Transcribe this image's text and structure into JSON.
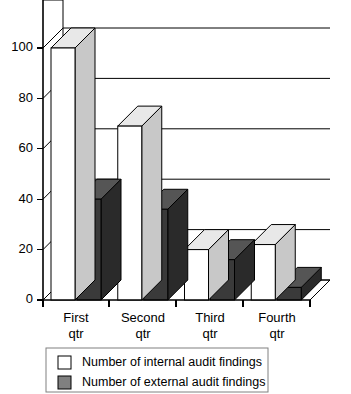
{
  "chart_data": {
    "type": "bar",
    "title": "",
    "subtitle": "",
    "xlabel": "",
    "ylabel": "",
    "categories": [
      "First\nqtr",
      "Second\nqtr",
      "Third\nqtr",
      "Fourth\nqtr"
    ],
    "category_lines": [
      [
        "First",
        "qtr"
      ],
      [
        "Second",
        "qtr"
      ],
      [
        "Third",
        "qtr"
      ],
      [
        "Fourth",
        "qtr"
      ]
    ],
    "series": [
      {
        "name": "Number of internal audit findings",
        "values": [
          100,
          69,
          20,
          22
        ],
        "face_color": "#ffffff",
        "top_color": "#e8e8e8",
        "side_color": "#c8c8c8"
      },
      {
        "name": "Number of external audit findings",
        "values": [
          40,
          36,
          16,
          5
        ],
        "face_color": "#3a3a3a",
        "top_color": "#555555",
        "side_color": "#2a2a2a"
      }
    ],
    "ylim": [
      0,
      100
    ],
    "yticks": [
      0,
      20,
      40,
      60,
      80,
      100
    ],
    "ytick_labels": [
      "0",
      "20",
      "40",
      "60",
      "80",
      "100"
    ],
    "grid": true,
    "grid_axis": "y",
    "legend_position": "bottom",
    "projection": "3d"
  },
  "legend": {
    "entries": [
      {
        "label": "Number of internal audit findings",
        "swatch": "#ffffff"
      },
      {
        "label": "Number of external audit findings",
        "swatch": "#808080"
      }
    ]
  },
  "colors": {
    "axis": "#000000",
    "grid": "#000000",
    "background": "#ffffff",
    "legend_border": "#808080"
  }
}
